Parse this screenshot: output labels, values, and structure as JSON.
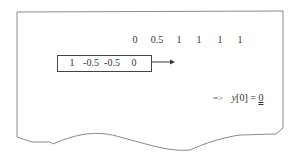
{
  "diagram": {
    "type": "discrete-convolution-step",
    "signal_row": {
      "values": [
        "0",
        "0.5",
        "1",
        "1",
        "1",
        "1"
      ],
      "x_positions": [
        135,
        157,
        179,
        199,
        220,
        240
      ]
    },
    "kernel_box": {
      "values": [
        "1",
        "-0.5",
        "-0.5",
        "0"
      ],
      "x_positions": [
        72,
        90,
        112,
        134
      ]
    },
    "shift_arrow": {
      "direction": "right"
    },
    "result": {
      "implies": "=>",
      "expression": "y[0] =",
      "variable": "y",
      "index": "[0]",
      "equals": "=",
      "value": "0"
    },
    "colors": {
      "frame": "#888888",
      "text": "#333333",
      "box_border": "#444444"
    }
  }
}
